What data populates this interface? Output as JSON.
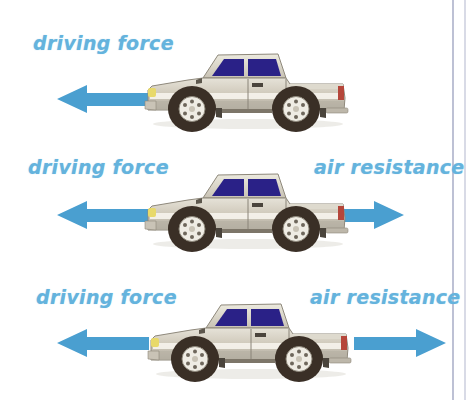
{
  "diagram": {
    "background_color": "#ffffff",
    "label_color": "#64b3dd",
    "arrow_color": "#4a9fd0",
    "truck": {
      "body_color": "#cfc9bb",
      "body_highlight": "#e4e0d6",
      "body_shadow": "#9b968a",
      "window_color": "#2a2187",
      "stripe_color": "#f2efe8",
      "tire_color": "#3a2f26",
      "rim_color": "#efece4",
      "headlight_color": "#e8d96a",
      "taillight_color": "#b5463a",
      "facing": "left"
    },
    "rows": [
      {
        "id": "row-1",
        "left_label": "driving force",
        "right_label": "",
        "left_arrow": {
          "direction": "left",
          "length": 90,
          "visible": true
        },
        "right_arrow": {
          "direction": "right",
          "length": 0,
          "visible": false
        }
      },
      {
        "id": "row-2",
        "left_label": "driving force",
        "right_label": "air resistance",
        "left_arrow": {
          "direction": "left",
          "length": 90,
          "visible": true
        },
        "right_arrow": {
          "direction": "right",
          "length": 58,
          "visible": true
        }
      },
      {
        "id": "row-3",
        "left_label": "driving force",
        "right_label": "air resistance",
        "left_arrow": {
          "direction": "left",
          "length": 90,
          "visible": true
        },
        "right_arrow": {
          "direction": "right",
          "length": 92,
          "visible": true
        }
      }
    ]
  }
}
